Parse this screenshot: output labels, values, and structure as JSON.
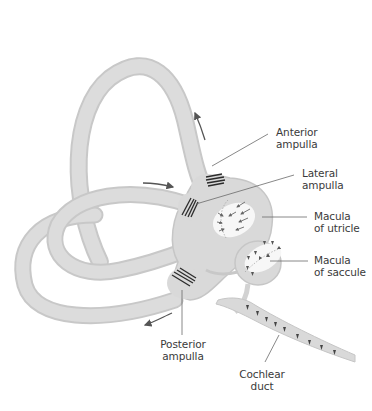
{
  "diagram": {
    "colors": {
      "tissue": "#d9d9d9",
      "tissue_edge": "#c4c4c4",
      "macula": "#f7f7f7",
      "hair_bundles": "#2b2b2b",
      "arrow": "#555555",
      "leader_line": "#6a6a6a",
      "text": "#3a3a3a",
      "background": "#ffffff"
    },
    "labels": [
      {
        "id": "anterior-ampulla",
        "line1": "Anterior",
        "line2": "ampulla"
      },
      {
        "id": "lateral-ampulla",
        "line1": "Lateral",
        "line2": "ampulla"
      },
      {
        "id": "macula-utricle",
        "line1": "Macula",
        "line2": "of utricle"
      },
      {
        "id": "macula-saccule",
        "line1": "Macula",
        "line2": "of saccule"
      },
      {
        "id": "posterior-ampulla",
        "line1": "Posterior",
        "line2": "ampulla"
      },
      {
        "id": "cochlear-duct",
        "line1": "Cochlear",
        "line2": "duct"
      }
    ]
  }
}
